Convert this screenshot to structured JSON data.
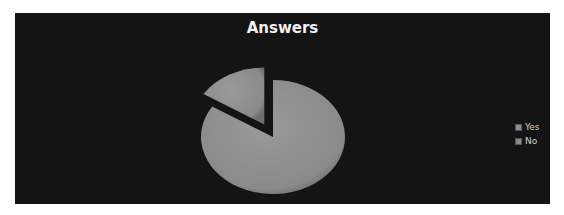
{
  "chart_data": {
    "type": "pie",
    "title": "Answers",
    "categories": [
      "Yes",
      "No"
    ],
    "values": [
      84,
      16
    ],
    "style": "3d-exploded",
    "legend_position": "right",
    "colors": [
      "#8e8e8e",
      "#8a8a8a"
    ]
  },
  "legend": {
    "items": [
      {
        "label": "Yes",
        "color": "#8e8e8e"
      },
      {
        "label": "No",
        "color": "#8a8a8a"
      }
    ]
  },
  "colors": {
    "background": "#141414",
    "title": "#f2f2f2"
  }
}
